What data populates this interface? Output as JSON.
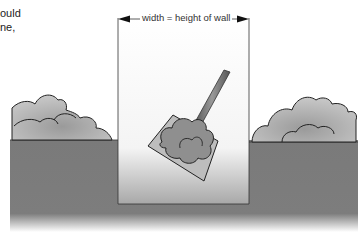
{
  "caption_fragment": {
    "line1": "ould",
    "line2": "ne,"
  },
  "diagram": {
    "dimension_label": "width = height of wall",
    "elements": [
      "ground",
      "pit",
      "soil-mound-left",
      "soil-mound-right",
      "shovel-with-soil",
      "width-dimension-arrow"
    ],
    "colors": {
      "ground": "#7a7a7a",
      "soil": "#8c8c8c",
      "pit": "#ffffff",
      "outline": "#222222"
    }
  }
}
